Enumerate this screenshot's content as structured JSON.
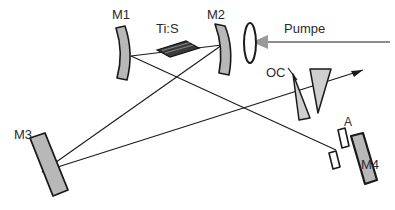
{
  "figure": {
    "kind": "optical-layout-diagram",
    "background_color": "#ffffff",
    "line_color": "#1a1a1a",
    "pump_beam_color": "#8c8c8c",
    "mirror_fill": "#b8b8b8",
    "crystal_fill": "#3a3a3a"
  },
  "labels": {
    "m1": "M1",
    "m2": "M2",
    "m3": "M3",
    "m4": "M4",
    "crystal": "Ti:S",
    "pump": "Pumpe",
    "output_coupler": "OC",
    "aperture": "A"
  },
  "components": [
    {
      "id": "m1",
      "name": "M1",
      "type": "concave-mirror",
      "label": "M1",
      "role": "curved cavity fold mirror (left of crystal)"
    },
    {
      "id": "tis",
      "name": "Ti:S",
      "type": "brewster-cut-crystal",
      "label": "Ti:S",
      "role": "Ti:Sapphire gain medium"
    },
    {
      "id": "m2",
      "name": "M2",
      "type": "concave-mirror",
      "label": "M2",
      "role": "curved cavity fold mirror (right of crystal)"
    },
    {
      "id": "lens",
      "name": "pump-lens",
      "type": "lens",
      "label": "",
      "role": "pump focusing lens"
    },
    {
      "id": "pump",
      "name": "Pumpe",
      "type": "beam-arrow",
      "label": "Pumpe",
      "role": "pump beam entering from the right"
    },
    {
      "id": "m3",
      "name": "M3",
      "type": "flat-mirror",
      "label": "M3",
      "role": "flat end mirror (lower left)"
    },
    {
      "id": "oc",
      "name": "OC",
      "type": "prism-pair-output-coupler",
      "label": "OC",
      "role": "output coupler with prism pair"
    },
    {
      "id": "aperture",
      "name": "A",
      "type": "aperture",
      "label": "A",
      "role": "aperture / slit in front of M4"
    },
    {
      "id": "m4",
      "name": "M4",
      "type": "flat-mirror",
      "label": "M4",
      "role": "flat end mirror (lower right)"
    },
    {
      "id": "output",
      "name": "output-beam",
      "type": "beam-arrow",
      "label": "",
      "role": "output beam leaving to upper right"
    }
  ],
  "label_positions": {
    "m1": {
      "x": 112,
      "y": 8
    },
    "crystal": {
      "x": 156,
      "y": 22
    },
    "m2": {
      "x": 207,
      "y": 8
    },
    "pump": {
      "x": 284,
      "y": 22
    },
    "oc": {
      "x": 266,
      "y": 66
    },
    "aperture": {
      "x": 344,
      "y": 116
    },
    "m3": {
      "x": 14,
      "y": 128
    },
    "m4": {
      "x": 361,
      "y": 158
    }
  }
}
